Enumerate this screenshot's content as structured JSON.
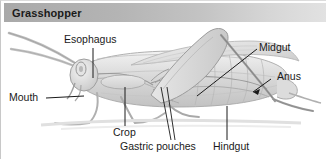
{
  "header": {
    "title": "Grasshopper",
    "bar_color_left": "#a9a9a9",
    "bar_color_right": "#e2e2e2"
  },
  "figure": {
    "style": "grayscale pencil illustration",
    "background": "#ffffff",
    "label_color": "#1a1a1a"
  },
  "labels": {
    "esophagus": "Esophagus",
    "mouth": "Mouth",
    "midgut": "Midgut",
    "anus": "Anus",
    "crop": "Crop",
    "gastric_pouches": "Gastric pouches",
    "hindgut": "Hindgut"
  }
}
